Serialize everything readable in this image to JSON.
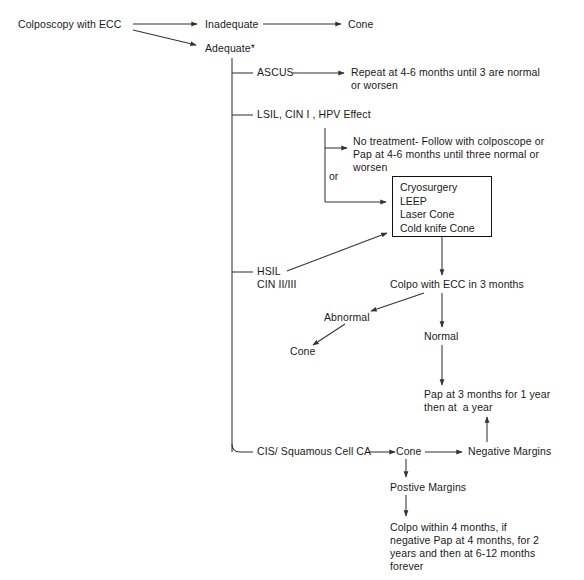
{
  "diagram": {
    "line_color": "#333333",
    "text_color": "#1a1a1a",
    "background": "#ffffff"
  },
  "nodes": {
    "start": "Colposcopy with ECC",
    "inadequate": "Inadequate",
    "inadequate_cone": "Cone",
    "adequate": "Adequate*",
    "ascus": "ASCUS",
    "ascus_followup_line1": "Repeat at 4-6 months until 3 are normal",
    "ascus_followup_line2": "or worsen",
    "lsil": "LSIL, CIN I , HPV Effect",
    "lsil_notreat_line1": "No treatment- Follow with colposcope or",
    "lsil_notreat_line2": "Pap at 4-6 months until three normal or",
    "lsil_notreat_line3": "worsen",
    "or_label": "or",
    "treatment_box": [
      "Cryosurgery",
      "LEEP",
      "Laser Cone",
      "Cold knife Cone"
    ],
    "hsil_line1": "HSIL",
    "hsil_line2": "CIN II/III",
    "colpo_ecc_3months": "Colpo with ECC in 3 months",
    "abnormal": "Abnormal",
    "abnormal_cone": "Cone",
    "normal": "Normal",
    "pap_followup_line1": "Pap at 3 months for 1 year",
    "pap_followup_line2": "then at  a year",
    "cis": "CIS/ Squamous Cell CA",
    "cis_cone": "Cone",
    "negative_margins": "Negative Margins",
    "positive_margins": "Postive Margins",
    "positive_followup_line1": "Colpo within 4 months, if",
    "positive_followup_line2": "negative Pap at 4 months, for 2",
    "positive_followup_line3": "years and then at 6-12 months",
    "positive_followup_line4": "forever"
  }
}
